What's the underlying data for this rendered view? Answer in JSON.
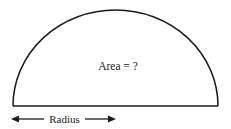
{
  "figure": {
    "type": "geometry-diagram",
    "shape": "semicircle",
    "background_color": "#ffffff",
    "stroke_color": "#1b1b1b",
    "text_color": "#1a1a1a",
    "labels": {
      "area_label": "Area = ?",
      "radius_label": "Radius"
    },
    "geometry": {
      "baseline_y": 106,
      "baseline_x_start": 13,
      "baseline_x_end": 218,
      "arc_apex_y": 10,
      "center_x": 115.5,
      "radius_px": 102.5
    },
    "dimension_arrow": {
      "y": 119,
      "x_start": 11,
      "x_end": 116,
      "double_headed": true,
      "label": "Radius",
      "measures": "radius"
    }
  }
}
